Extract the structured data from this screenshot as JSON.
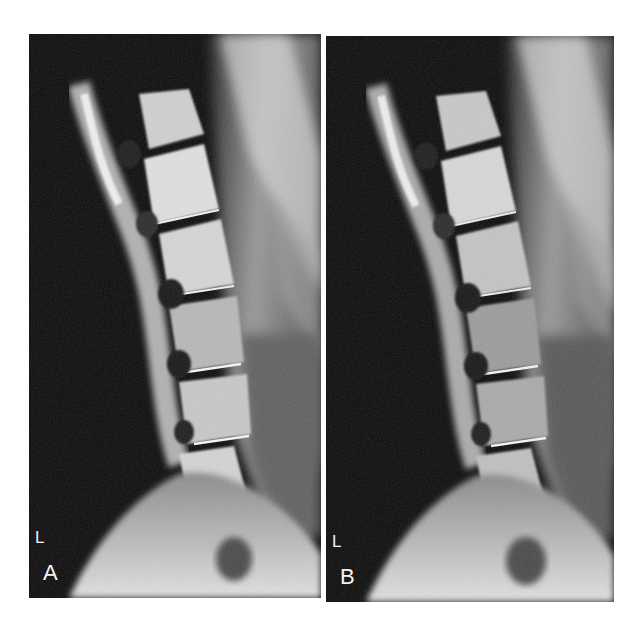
{
  "figure": {
    "panels": [
      {
        "id": "A",
        "panel_label": "A",
        "side_marker": "L"
      },
      {
        "id": "B",
        "panel_label": "B",
        "side_marker": "L"
      }
    ]
  },
  "colors": {
    "background": "#ffffff",
    "film_dark": "#0a0a0a",
    "bone_light": "#e6e6e6",
    "soft_tissue": "#6e6e6e",
    "label": "#f4f4f4"
  }
}
